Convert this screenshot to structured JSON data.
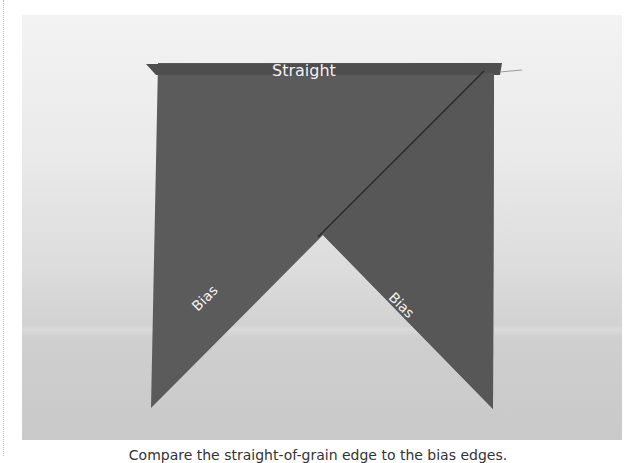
{
  "figure": {
    "fabric_color": "#5a5a5a",
    "background_color": "#e6e6e6",
    "labels": {
      "top": "Straight",
      "left_edge": "Bias",
      "right_edge": "Bias"
    },
    "caption": "Compare the straight-of-grain edge to the bias edges."
  }
}
